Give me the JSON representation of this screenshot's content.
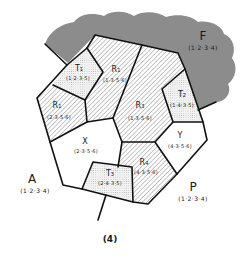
{
  "figure_label": "(4)",
  "colors": {
    "forest_fill": "#8c8c8c",
    "hatch_stroke": "#9a9a9a",
    "dot_fill": "#b0b0b0",
    "edge": "#111111",
    "background": "#ffffff"
  },
  "outer_regions": {
    "F": {
      "name": "F",
      "code": "(1·2·3·4)"
    },
    "A": {
      "name": "A",
      "code": "(1·2·3·4)"
    },
    "P": {
      "name": "P",
      "code": "(1·2·3·4)"
    }
  },
  "regions": [
    {
      "id": "T1",
      "name": "T₁",
      "code": "(1·2·3·5)",
      "pattern": "dotted"
    },
    {
      "id": "R1",
      "name": "R₁",
      "code": "(1·3·5·6)",
      "pattern": "hatched"
    },
    {
      "id": "R2",
      "name": "R₁",
      "code": "(2·3·5·6)",
      "pattern": "hatched"
    },
    {
      "id": "R3",
      "name": "R₃",
      "code": "(1·3·5·6)",
      "pattern": "hatched"
    },
    {
      "id": "T2",
      "name": "T₂",
      "code": "(1·4·3·5)",
      "pattern": "dotted"
    },
    {
      "id": "X",
      "name": "X",
      "code": "(2·3·5·6)",
      "pattern": "blank"
    },
    {
      "id": "Y",
      "name": "Y",
      "code": "(4·3·5·6)",
      "pattern": "blank"
    },
    {
      "id": "R4",
      "name": "R₄",
      "code": "(4·3·5·6)",
      "pattern": "hatched"
    },
    {
      "id": "T3",
      "name": "T₃",
      "code": "(2·4·3·5)",
      "pattern": "dotted"
    }
  ]
}
